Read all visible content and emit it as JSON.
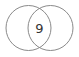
{
  "diagram": {
    "type": "venn",
    "stroke_color": "#8a8a8a",
    "background": "#ffffff",
    "sets": [
      {
        "name": "left-set",
        "cx": 28.5,
        "cy": 28,
        "r": 22.5
      },
      {
        "name": "right-set",
        "cx": 50.5,
        "cy": 28,
        "r": 22.5
      }
    ],
    "intersection": {
      "label": "9",
      "x": 39.5,
      "y": 28
    }
  }
}
